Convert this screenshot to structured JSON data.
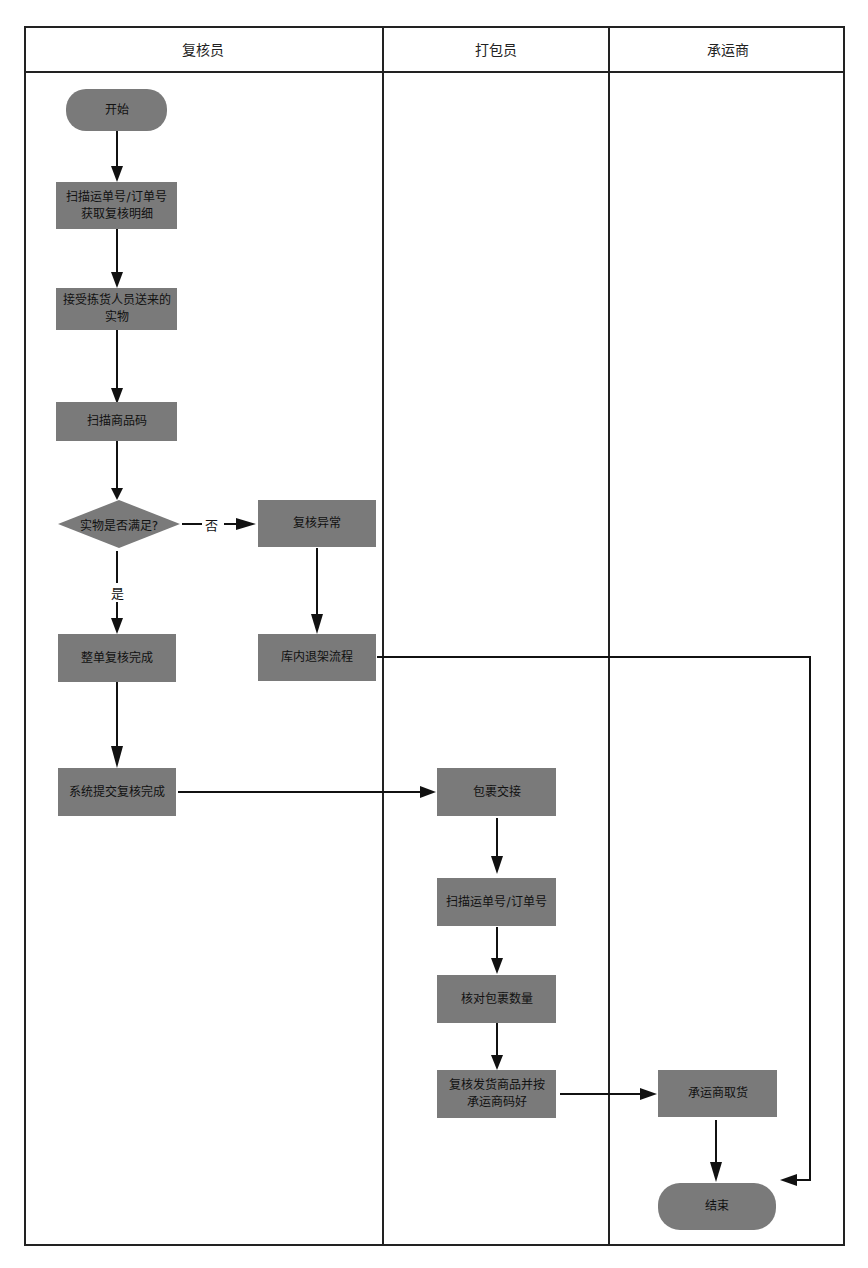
{
  "lanes": [
    {
      "label": "复核员"
    },
    {
      "label": "打包员"
    },
    {
      "label": "承运商"
    }
  ],
  "nodes": {
    "start": "开始",
    "scan_waybill": "扫描运单号/订单号获取复核明细",
    "receive_goods": "接受拣货人员送来的实物",
    "scan_product": "扫描商品码",
    "decision": "实物是否满足?",
    "review_exception": "复核异常",
    "order_review_done": "整单复核完成",
    "return_shelf": "库内退架流程",
    "system_submit": "系统提交复核完成",
    "package_handover": "包裹交接",
    "scan_waybill_packer": "扫描运单号/订单号",
    "check_package_count": "核对包裹数量",
    "review_ship_goods": "复核发货商品并按承运商码好",
    "carrier_pickup": "承运商取货",
    "end": "结束"
  },
  "edge_labels": {
    "no": "否",
    "yes": "是"
  },
  "colors": {
    "node_fill": "#7a7a7a",
    "line": "#111111",
    "border": "#222222"
  }
}
